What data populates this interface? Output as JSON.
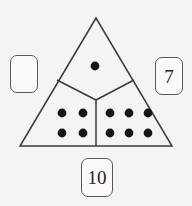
{
  "figure": {
    "shape": "triangle",
    "background_color": "#f6f4f1",
    "line_color": "#3a3a3a",
    "dot_color": "#151515",
    "box_border_color": "#58585a",
    "box_fill_color": "#fbfaf8",
    "text_color": "#232323",
    "triangle": {
      "apex": [
        96,
        18
      ],
      "base_left": [
        20,
        146
      ],
      "base_right": [
        172,
        146
      ],
      "junction_center": [
        96,
        100
      ],
      "junction_left_edge": [
        57,
        80
      ],
      "junction_right_edge": [
        134,
        80
      ]
    },
    "regions": [
      {
        "name": "top-region",
        "dot_count": 1,
        "dot_layout": "1",
        "dots": [
          [
            95,
            66
          ]
        ]
      },
      {
        "name": "bottom-left-region",
        "dot_count": 4,
        "dot_layout": "2x2",
        "dots": [
          [
            62,
            113
          ],
          [
            83,
            113
          ],
          [
            62,
            133
          ],
          [
            83,
            133
          ]
        ]
      },
      {
        "name": "bottom-right-region",
        "dot_count": 6,
        "dot_layout": "3x2",
        "dots": [
          [
            110,
            113
          ],
          [
            129,
            113
          ],
          [
            148,
            113
          ],
          [
            110,
            133
          ],
          [
            129,
            133
          ],
          [
            148,
            133
          ]
        ]
      }
    ],
    "dot_radius": 4.4
  },
  "boxes": {
    "left": {
      "label": "",
      "filled": false
    },
    "right": {
      "label": "7",
      "filled": true
    },
    "bottom": {
      "label": "10",
      "filled": true
    }
  }
}
